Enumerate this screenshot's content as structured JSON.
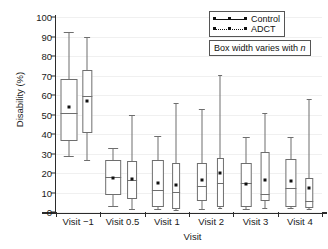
{
  "chart_data": {
    "type": "box",
    "title": "",
    "xlabel": "Visit",
    "ylabel": "Disability (%)",
    "ylim": [
      0,
      100
    ],
    "ytick_step": 10,
    "ytick_labels": [
      "100",
      "90",
      "80",
      "70",
      "60",
      "50",
      "40",
      "30",
      "20",
      "10",
      "0"
    ],
    "grid": true,
    "legend_position": "top-right",
    "categories": [
      "Visit −1",
      "Visit 0.5",
      "Visit 1",
      "Visit 2",
      "Visit 3",
      "Visit 4"
    ],
    "series": [
      {
        "name": "Control",
        "marker": "filled-square",
        "line_style": "solid",
        "boxes": [
          {
            "category": "Visit −1",
            "whisker_low": 28.5,
            "q1": 36.5,
            "median": 51.0,
            "q3": 68.0,
            "whisker_high": 92.5,
            "mean": 54.0,
            "width": 1.0
          },
          {
            "category": "Visit 0.5",
            "whisker_low": 3.0,
            "q1": 8.5,
            "median": 18.0,
            "q3": 26.5,
            "whisker_high": 33.0,
            "mean": 17.5,
            "width": 0.92
          },
          {
            "category": "Visit 1",
            "whisker_low": 1.5,
            "q1": 2.5,
            "median": 11.5,
            "q3": 26.5,
            "whisker_high": 39.0,
            "mean": 15.0,
            "width": 0.72
          },
          {
            "category": "Visit 2",
            "whisker_low": 1.5,
            "q1": 5.5,
            "median": 13.5,
            "q3": 25.0,
            "whisker_high": 53.0,
            "mean": 16.5,
            "width": 0.6
          },
          {
            "category": "Visit 3",
            "whisker_low": 1.5,
            "q1": 2.5,
            "median": 15.0,
            "q3": 25.0,
            "whisker_high": 38.5,
            "mean": 14.5,
            "width": 0.62
          },
          {
            "category": "Visit 4",
            "whisker_low": 2.0,
            "q1": 2.5,
            "median": 12.5,
            "q3": 27.0,
            "whisker_high": 38.5,
            "mean": 16.0,
            "width": 0.66
          }
        ]
      },
      {
        "name": "ADCT",
        "marker": "filled-square",
        "line_style": "dotted",
        "boxes": [
          {
            "category": "Visit −1",
            "whisker_low": 26.5,
            "q1": 40.5,
            "median": 59.5,
            "q3": 73.0,
            "whisker_high": 90.0,
            "mean": 57.0,
            "width": 0.55
          },
          {
            "category": "Visit 0.5",
            "whisker_low": 1.5,
            "q1": 6.5,
            "median": 16.5,
            "q3": 26.0,
            "whisker_high": 49.5,
            "mean": 17.0,
            "width": 0.58
          },
          {
            "category": "Visit 1",
            "whisker_low": 1.0,
            "q1": 1.5,
            "median": 10.5,
            "q3": 25.0,
            "whisker_high": 56.0,
            "mean": 14.0,
            "width": 0.46
          },
          {
            "category": "Visit 2",
            "whisker_low": 2.0,
            "q1": 2.5,
            "median": 15.0,
            "q3": 27.5,
            "whisker_high": 70.5,
            "mean": 20.0,
            "width": 0.36
          },
          {
            "category": "Visit 3",
            "whisker_low": 2.0,
            "q1": 5.5,
            "median": 9.0,
            "q3": 31.0,
            "whisker_high": 51.0,
            "mean": 16.5,
            "width": 0.52
          },
          {
            "category": "Visit 4",
            "whisker_low": 1.5,
            "q1": 2.0,
            "median": 5.5,
            "q3": 17.5,
            "whisker_high": 58.0,
            "mean": 12.5,
            "width": 0.44
          }
        ]
      }
    ]
  },
  "legend": {
    "entries": [
      {
        "label": "Control"
      },
      {
        "label": "ADCT"
      }
    ]
  },
  "note": {
    "prefix": "Box width varies with",
    "symbol": "n"
  }
}
